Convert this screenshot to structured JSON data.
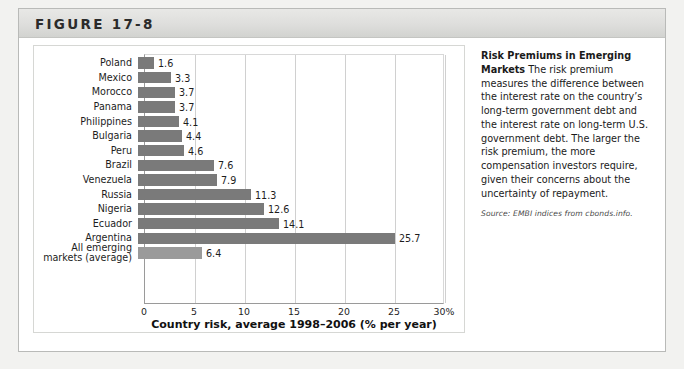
{
  "figure": {
    "number_label": "FIGURE 17-8"
  },
  "caption": {
    "lead": "Risk Premiums in Emerging Markets",
    "body": " The risk premium measures the difference between the interest rate on the country’s long-term government debt and the interest rate on long-term U.S. government debt. The larger the risk premium, the more compensation investors require, given their concerns about the uncertainty of repayment.",
    "source": "Source: EMBI indices from cbonds.info."
  },
  "chart_data": {
    "type": "bar",
    "orientation": "horizontal",
    "title": "",
    "xlabel": "Country risk, average 1998–2006 (% per year)",
    "ylabel": "",
    "xlim": [
      0,
      30
    ],
    "xticks": [
      0,
      5,
      10,
      15,
      20,
      25,
      30
    ],
    "xticklabels": [
      "0",
      "5",
      "10",
      "15",
      "20",
      "25",
      "30%"
    ],
    "grid": "vertical",
    "legend": "none",
    "bar_color": "#7a7a7a",
    "average_bar_color": "#9a9a9a",
    "categories": [
      "Poland",
      "Mexico",
      "Morocco",
      "Panama",
      "Philippines",
      "Bulgaria",
      "Peru",
      "Brazil",
      "Venezuela",
      "Russia",
      "Nigeria",
      "Ecuador",
      "Argentina",
      "All emerging markets (average)"
    ],
    "values": [
      1.6,
      3.3,
      3.7,
      3.7,
      4.1,
      4.4,
      4.6,
      7.6,
      7.9,
      11.3,
      12.6,
      14.1,
      25.7,
      6.4
    ],
    "value_labels": [
      "1.6",
      "3.3",
      "3.7",
      "3.7",
      "4.1",
      "4.4",
      "4.6",
      "7.6",
      "7.9",
      "11.3",
      "12.6",
      "14.1",
      "25.7",
      "6.4"
    ],
    "category_lines": [
      [
        "Poland"
      ],
      [
        "Mexico"
      ],
      [
        "Morocco"
      ],
      [
        "Panama"
      ],
      [
        "Philippines"
      ],
      [
        "Bulgaria"
      ],
      [
        "Peru"
      ],
      [
        "Brazil"
      ],
      [
        "Venezuela"
      ],
      [
        "Russia"
      ],
      [
        "Nigeria"
      ],
      [
        "Ecuador"
      ],
      [
        "Argentina"
      ],
      [
        "All emerging",
        "markets (average)"
      ]
    ]
  }
}
